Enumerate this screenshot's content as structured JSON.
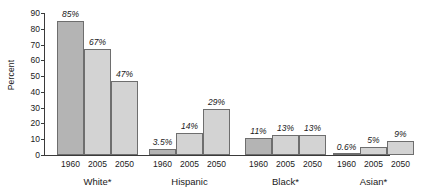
{
  "chart_data": {
    "type": "bar",
    "title": "",
    "xlabel": "",
    "ylabel": "Percent",
    "ylim": [
      0,
      90
    ],
    "ytick_labels": [
      "0",
      "10",
      "20",
      "30",
      "40",
      "50",
      "60",
      "70",
      "80",
      "90"
    ],
    "ytick_values": [
      0,
      10,
      20,
      30,
      40,
      50,
      60,
      70,
      80,
      90
    ],
    "grid": false,
    "legend": "none",
    "x_tick_labels": [
      "1960",
      "2005",
      "2050"
    ],
    "groups": [
      {
        "name": "White*",
        "bars": [
          {
            "year": "1960",
            "value": 85,
            "label": "85%",
            "shade": "dark"
          },
          {
            "year": "2005",
            "value": 67,
            "label": "67%",
            "shade": "light"
          },
          {
            "year": "2050",
            "value": 47,
            "label": "47%",
            "shade": "light"
          }
        ]
      },
      {
        "name": "Hispanic",
        "bars": [
          {
            "year": "1960",
            "value": 3.5,
            "label": "3.5%",
            "shade": "dark"
          },
          {
            "year": "2005",
            "value": 14,
            "label": "14%",
            "shade": "light"
          },
          {
            "year": "2050",
            "value": 29,
            "label": "29%",
            "shade": "light"
          }
        ]
      },
      {
        "name": "Black*",
        "bars": [
          {
            "year": "1960",
            "value": 11,
            "label": "11%",
            "shade": "dark"
          },
          {
            "year": "2005",
            "value": 13,
            "label": "13%",
            "shade": "light"
          },
          {
            "year": "2050",
            "value": 13,
            "label": "13%",
            "shade": "light"
          }
        ]
      },
      {
        "name": "Asian*",
        "bars": [
          {
            "year": "1960",
            "value": 0.6,
            "label": "0.6%",
            "shade": "dark"
          },
          {
            "year": "2005",
            "value": 5,
            "label": "5%",
            "shade": "light"
          },
          {
            "year": "2050",
            "value": 9,
            "label": "9%",
            "shade": "light"
          }
        ]
      }
    ],
    "colors": {
      "bar_1960": "#b4b4b4",
      "bar_2005": "#d3d3d3",
      "bar_2050": "#d3d3d3",
      "bar_outline": "#6e6e6e",
      "axis": "#3a3a3a",
      "text": "#1a1a1a",
      "background": "#ffffff"
    }
  }
}
